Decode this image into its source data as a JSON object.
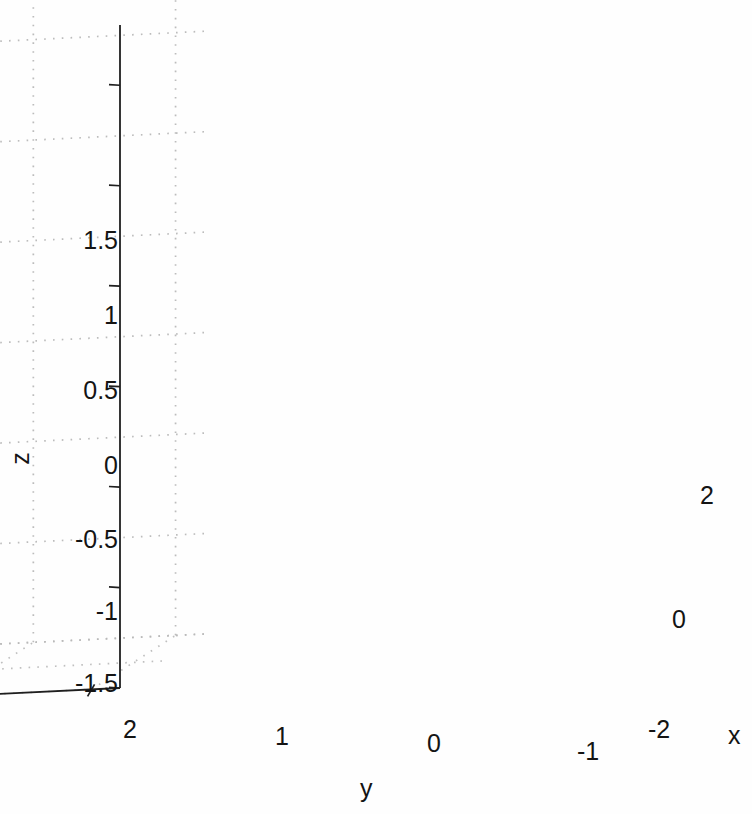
{
  "figure": {
    "background_color": "#fefefe",
    "width": 752,
    "height": 814,
    "grid_color": "#b9b9b9",
    "axis_line_color": "#1f1f1f"
  },
  "axes": {
    "x": {
      "label": "x",
      "ticks": [
        "-2",
        "0",
        "2"
      ],
      "tick_values": [
        -2,
        0,
        2
      ],
      "range": [
        -2,
        2
      ]
    },
    "y": {
      "label": "y",
      "ticks": [
        "2",
        "1",
        "0",
        "-1"
      ],
      "tick_values": [
        2,
        1,
        0,
        -1
      ],
      "range": [
        -1.4,
        2.2
      ]
    },
    "z": {
      "label": "z",
      "ticks": [
        "1.5",
        "1",
        "0.5",
        "0",
        "-0.5",
        "-1",
        "-1.5"
      ],
      "tick_values": [
        1.5,
        1,
        0.5,
        0,
        -0.5,
        -1,
        -1.5
      ],
      "range": [
        -1.5,
        1.8
      ]
    }
  },
  "series": [
    {
      "name": "ring-dark",
      "color": "#262626",
      "marker": "circle",
      "marker_size": 11,
      "point_count": 340,
      "shape": "circle",
      "center": [
        0.55,
        0.85,
        0.62
      ],
      "radius": 1.18,
      "normal": [
        0.96,
        0.08,
        0.26
      ],
      "noise": 0.055
    },
    {
      "name": "ring-gray",
      "color": "#9c9c9c",
      "marker": "circle",
      "marker_size": 11,
      "point_count": 340,
      "shape": "circle",
      "center": [
        -0.35,
        -0.12,
        0.62
      ],
      "radius": 1.18,
      "normal": [
        0.06,
        0.3,
        0.95
      ],
      "noise": 0.055
    }
  ],
  "chart_data": {
    "type": "scatter",
    "dimensionality": "3d",
    "title": "",
    "xlabel": "x",
    "ylabel": "y",
    "zlabel": "z",
    "xlim": [
      -2,
      2
    ],
    "ylim": [
      -1.4,
      2.2
    ],
    "zlim": [
      -1.5,
      1.8
    ],
    "xticks": [
      -2,
      0,
      2
    ],
    "yticks": [
      2,
      1,
      0,
      -1
    ],
    "zticks": [
      1.5,
      1,
      0.5,
      0,
      -0.5,
      -1,
      -1.5
    ],
    "xticklabels": [
      "-2",
      "0",
      "2"
    ],
    "yticklabels": [
      "2",
      "1",
      "0",
      "-1"
    ],
    "zticklabels": [
      "1.5",
      "1",
      "0.5",
      "0",
      "-0.5",
      "-1",
      "-1.5"
    ],
    "grid": true,
    "grid_style": "dotted",
    "legend": false,
    "view_azimuth": -37.5,
    "view_elevation": 18,
    "series": [
      {
        "name": "cluster 1 (dark)",
        "color": "#262626",
        "n_points": 340,
        "geometry": "ring",
        "center": [
          0.55,
          0.85,
          0.62
        ],
        "radius": 1.18,
        "plane_normal": [
          0.96,
          0.08,
          0.26
        ],
        "scatter_sigma": 0.055
      },
      {
        "name": "cluster 2 (gray)",
        "color": "#9c9c9c",
        "n_points": 340,
        "geometry": "ring",
        "center": [
          -0.35,
          -0.12,
          0.62
        ],
        "radius": 1.18,
        "plane_normal": [
          0.06,
          0.3,
          0.95
        ],
        "scatter_sigma": 0.055
      }
    ]
  },
  "tick_labels": {
    "z": [
      {
        "text": "1.5",
        "x": 118,
        "y": 241
      },
      {
        "text": "1",
        "x": 118,
        "y": 316
      },
      {
        "text": "0.5",
        "x": 118,
        "y": 391
      },
      {
        "text": "0",
        "x": 118,
        "y": 466
      },
      {
        "text": "-0.5",
        "x": 118,
        "y": 540
      },
      {
        "text": "-1",
        "x": 118,
        "y": 612
      },
      {
        "text": "-1.5",
        "x": 118,
        "y": 684
      }
    ],
    "y": [
      {
        "text": "2",
        "x": 130,
        "y": 730
      },
      {
        "text": "1",
        "x": 282,
        "y": 737
      },
      {
        "text": "0",
        "x": 434,
        "y": 744
      },
      {
        "text": "-1",
        "x": 588,
        "y": 752
      }
    ],
    "x": [
      {
        "text": "-2",
        "x": 648,
        "y": 730
      },
      {
        "text": "0",
        "x": 672,
        "y": 620
      },
      {
        "text": "2",
        "x": 700,
        "y": 496
      }
    ]
  },
  "axis_titles": {
    "x": {
      "text": "x",
      "x": 728,
      "y": 737
    },
    "y": {
      "text": "y",
      "x": 360,
      "y": 790
    },
    "z": {
      "text": "z",
      "x": 24,
      "y": 460
    }
  }
}
